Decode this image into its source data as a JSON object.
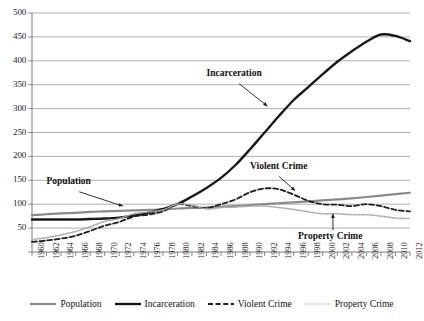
{
  "chart_data": {
    "type": "line",
    "title": "",
    "xlabel": "",
    "ylabel": "",
    "ylim": [
      0,
      500
    ],
    "ytick_step": 50,
    "grid": true,
    "legend_position": "bottom",
    "yticks": [
      0,
      50,
      100,
      150,
      200,
      250,
      300,
      350,
      400,
      450,
      500
    ],
    "ytick_labels": [
      "",
      "50",
      "100",
      "150",
      "200",
      "250",
      "300",
      "350",
      "400",
      "450",
      "500"
    ],
    "x": [
      1960,
      1962,
      1964,
      1966,
      1968,
      1970,
      1972,
      1974,
      1976,
      1978,
      1980,
      1982,
      1984,
      1986,
      1988,
      1990,
      1992,
      1994,
      1996,
      1998,
      2000,
      2002,
      2004,
      2006,
      2008,
      2010,
      2012
    ],
    "xtick_labels": [
      "1960",
      "1962",
      "1964",
      "1966",
      "1968",
      "1970",
      "1972",
      "1974",
      "1976",
      "1978",
      "1980",
      "1982",
      "1984",
      "1986",
      "1988",
      "1990",
      "1992",
      "1994",
      "1996",
      "1998",
      "2000",
      "2002",
      "2004",
      "2006",
      "2008",
      "2010",
      "2012"
    ],
    "series": [
      {
        "name": "Population",
        "style": "solid",
        "color": "#8a8a8a",
        "width": 2.2,
        "values": [
          77,
          79,
          81,
          82,
          84,
          85,
          86,
          87,
          88,
          89,
          91,
          92,
          93,
          95,
          96,
          98,
          100,
          102,
          104,
          106,
          108,
          110,
          112,
          115,
          118,
          121,
          124
        ]
      },
      {
        "name": "Incarceration",
        "style": "solid",
        "color": "#1a1a1a",
        "width": 2.4,
        "values": [
          68,
          68,
          68,
          68,
          69,
          70,
          72,
          76,
          82,
          90,
          100,
          116,
          134,
          155,
          182,
          215,
          250,
          285,
          318,
          345,
          372,
          398,
          420,
          440,
          455,
          452,
          441
        ]
      },
      {
        "name": "Violent Crime",
        "style": "dashed",
        "color": "#1f1f1f",
        "width": 1.8,
        "values": [
          21,
          24,
          28,
          34,
          44,
          55,
          63,
          74,
          78,
          85,
          100,
          96,
          92,
          100,
          110,
          125,
          133,
          131,
          120,
          107,
          100,
          99,
          96,
          100,
          96,
          88,
          85
        ]
      },
      {
        "name": "Property Crime",
        "style": "dotted",
        "color": "#a8a8a8",
        "width": 1.6,
        "values": [
          26,
          30,
          36,
          43,
          53,
          64,
          70,
          80,
          84,
          88,
          100,
          98,
          90,
          93,
          94,
          96,
          96,
          93,
          89,
          84,
          80,
          80,
          78,
          78,
          75,
          71,
          70
        ]
      }
    ],
    "annotations": [
      {
        "label": "Population",
        "x": 1962,
        "y": 145
      },
      {
        "label": "Incarceration",
        "x": 1984,
        "y": 370
      },
      {
        "label": "Violent Crime",
        "x": 1990,
        "y": 175
      },
      {
        "label": "Property Crime",
        "x": 2001,
        "y": 30
      }
    ]
  },
  "legend": {
    "items": [
      {
        "label": "Population",
        "swatch": "solid-gray"
      },
      {
        "label": "Incarceration",
        "swatch": "solid-black"
      },
      {
        "label": "Violent Crime",
        "swatch": "dashed-black"
      },
      {
        "label": "Property Crime",
        "swatch": "dotted-gray"
      }
    ]
  }
}
